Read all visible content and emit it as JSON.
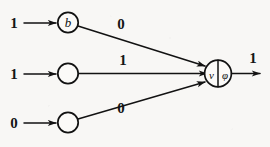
{
  "figure": {
    "background_color": "#f8f7f5",
    "ink_color": "#121212",
    "width": 270,
    "height": 147
  },
  "inputs": [
    {
      "id": "input-1",
      "value": "1",
      "node_label": "b",
      "node_has_label": true
    },
    {
      "id": "input-2",
      "value": "1",
      "node_label": "",
      "node_has_label": false
    },
    {
      "id": "input-3",
      "value": "0",
      "node_label": "",
      "node_has_label": false
    }
  ],
  "weights": [
    {
      "id": "weight-1",
      "value": "0"
    },
    {
      "id": "weight-2",
      "value": "1"
    },
    {
      "id": "weight-3",
      "value": "0"
    }
  ],
  "output_node": {
    "left_symbol": "ν",
    "right_symbol": "φ",
    "divider": "vertical-line"
  },
  "output": {
    "id": "output-1",
    "value": "1"
  }
}
